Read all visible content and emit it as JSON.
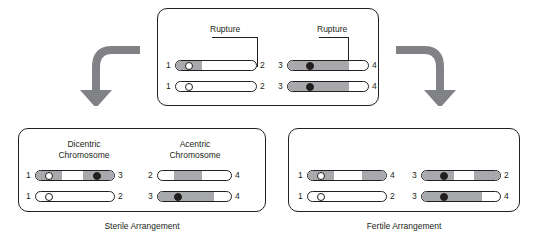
{
  "diagram": {
    "title_top": "",
    "top_panel": {
      "rupture_label_left": "Rupture",
      "rupture_label_right": "Rupture",
      "rows": [
        {
          "left_num": "1",
          "right_num": "2",
          "left_num2": "3",
          "right_num2": "4"
        },
        {
          "left_num": "1",
          "right_num": "2",
          "left_num2": "3",
          "right_num2": "4"
        }
      ]
    },
    "left_panel": {
      "heading_a_line1": "Dicentric",
      "heading_a_line2": "Chromosome",
      "heading_b_line1": "Acentric",
      "heading_b_line2": "Chromosome",
      "caption": "Sterile Arrangement",
      "rows": [
        {
          "a_left": "1",
          "a_right": "3",
          "b_left": "2",
          "b_right": "4"
        },
        {
          "a_left": "1",
          "a_right": "2",
          "b_left": "3",
          "b_right": "4"
        }
      ]
    },
    "right_panel": {
      "caption": "Fertile Arrangement",
      "rows": [
        {
          "a_left": "1",
          "a_right": "4",
          "b_left": "3",
          "b_right": "2"
        },
        {
          "a_left": "1",
          "a_right": "2",
          "b_left": "3",
          "b_right": "4"
        }
      ]
    },
    "colors": {
      "outline": "#231f20",
      "segment_gray": "#a7a9ac",
      "arrow_gray": "#808285",
      "background": "#ffffff"
    }
  }
}
